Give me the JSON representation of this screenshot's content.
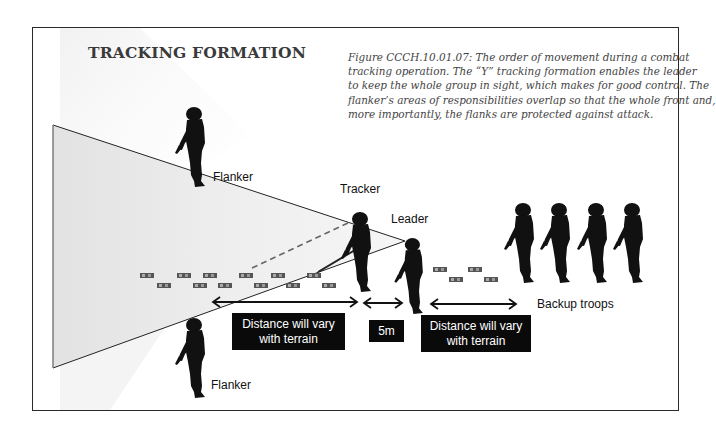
{
  "title": "TRACKING FORMATION",
  "caption": {
    "lines": [
      "Figure CCCH.10.01.07:  The order of movement during a combat",
      "tracking operation.  The “Y” tracking formation enables the leader",
      "to keep the whole group in sight, which makes for good control.  The",
      "flanker’s areas of responsibilities overlap so that the whole front and,",
      "more importantly, the flanks are protected against attack."
    ]
  },
  "roles": {
    "flanker_top": "Flanker",
    "tracker": "Tracker",
    "leader": "Leader",
    "backup": "Backup troops",
    "flanker_bottom": "Flanker"
  },
  "distance_boxes": {
    "tracker_gap": {
      "line1": "Distance will vary",
      "line2": "with terrain"
    },
    "leader_gap": "5m",
    "backup_gap": {
      "line1": "Distance will vary",
      "line2": "with terrain"
    }
  },
  "backup_troop_count": 4,
  "colors": {
    "frame_border": "#2a2a2a",
    "box_fill": "#0a0a0a",
    "box_text": "#ffffff",
    "silhouette": "#111111",
    "triangle_fill": "#ececec"
  }
}
